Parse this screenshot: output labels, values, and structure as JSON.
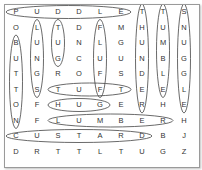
{
  "puzzle": {
    "rows": 10,
    "cols": 9,
    "grid": [
      [
        "P",
        "U",
        "D",
        "D",
        "L",
        "E",
        "T",
        "T",
        "S"
      ],
      [
        "O",
        "L",
        "T",
        "D",
        "F",
        "M",
        "H",
        "U",
        "N"
      ],
      [
        "B",
        "U",
        "U",
        "N",
        "L",
        "G",
        "U",
        "M",
        "U"
      ],
      [
        "U",
        "N",
        "G",
        "C",
        "U",
        "U",
        "N",
        "B",
        "G"
      ],
      [
        "T",
        "G",
        "R",
        "O",
        "F",
        "S",
        "D",
        "L",
        "G"
      ],
      [
        "T",
        "S",
        "T",
        "U",
        "F",
        "T",
        "E",
        "E",
        "L"
      ],
      [
        "O",
        "F",
        "H",
        "U",
        "G",
        "E",
        "R",
        "H",
        "E"
      ],
      [
        "N",
        "F",
        "L",
        "U",
        "M",
        "B",
        "E",
        "R",
        "H"
      ],
      [
        "C",
        "U",
        "S",
        "T",
        "A",
        "R",
        "D",
        "B",
        "J"
      ],
      [
        "D",
        "R",
        "T",
        "T",
        "L",
        "T",
        "U",
        "G",
        "Z"
      ]
    ],
    "found_words": [
      {
        "word": "PUDDLE",
        "dir": "h",
        "row": 0,
        "col": 0,
        "len": 6
      },
      {
        "word": "THUNDER",
        "dir": "v",
        "row": 0,
        "col": 6,
        "len": 7
      },
      {
        "word": "TUMBLE",
        "dir": "v",
        "row": 0,
        "col": 7,
        "len": 6
      },
      {
        "word": "SNUGGLE",
        "dir": "v",
        "row": 0,
        "col": 8,
        "len": 7
      },
      {
        "word": "LUNGS",
        "dir": "v",
        "row": 1,
        "col": 1,
        "len": 5
      },
      {
        "word": "TUG",
        "dir": "v",
        "row": 1,
        "col": 2,
        "len": 3
      },
      {
        "word": "FLUFF",
        "dir": "v",
        "row": 1,
        "col": 4,
        "len": 5
      },
      {
        "word": "BUTTON",
        "dir": "v",
        "row": 2,
        "col": 0,
        "len": 6
      },
      {
        "word": "TUFT",
        "dir": "h",
        "row": 5,
        "col": 2,
        "len": 4
      },
      {
        "word": "HUG",
        "dir": "h",
        "row": 6,
        "col": 2,
        "len": 3
      },
      {
        "word": "LUMBER",
        "dir": "h",
        "row": 7,
        "col": 2,
        "len": 6
      },
      {
        "word": "CUSTARD",
        "dir": "h",
        "row": 8,
        "col": 0,
        "len": 7
      }
    ],
    "colors": {
      "border": "#9a9a9a",
      "ring": "#444444",
      "letter": "#333333"
    }
  }
}
